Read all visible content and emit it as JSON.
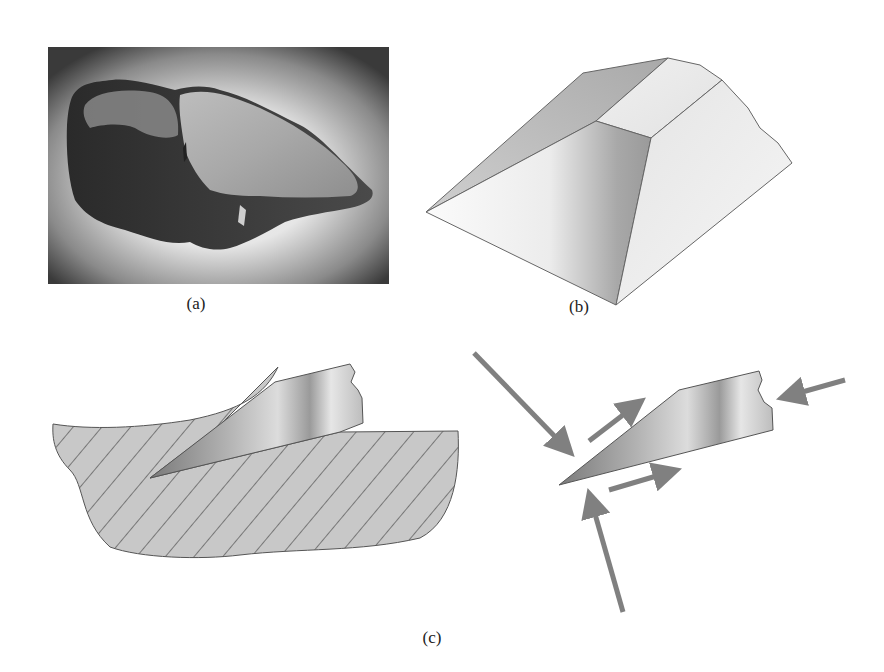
{
  "figure": {
    "panels": [
      {
        "id": "a",
        "label": "(a)",
        "description": "Photograph of a flaked stone tool (chopper) on a gradient grey backdrop"
      },
      {
        "id": "b",
        "label": "(b)",
        "description": "Idealized 3D wedge / flaked block showing planar fracture faces"
      },
      {
        "id": "c",
        "label": "(c)",
        "description": "Cross-section of a cutting edge penetrating material (hatched) and force diagram on the wedge with arrows"
      }
    ]
  },
  "colors": {
    "hatch_fill": "#c8c8c8",
    "hatch_line": "#333333",
    "arrow": "#808080",
    "outline": "#555555"
  },
  "captions": {
    "a": "(a)",
    "b": "(b)",
    "c": "(c)"
  }
}
